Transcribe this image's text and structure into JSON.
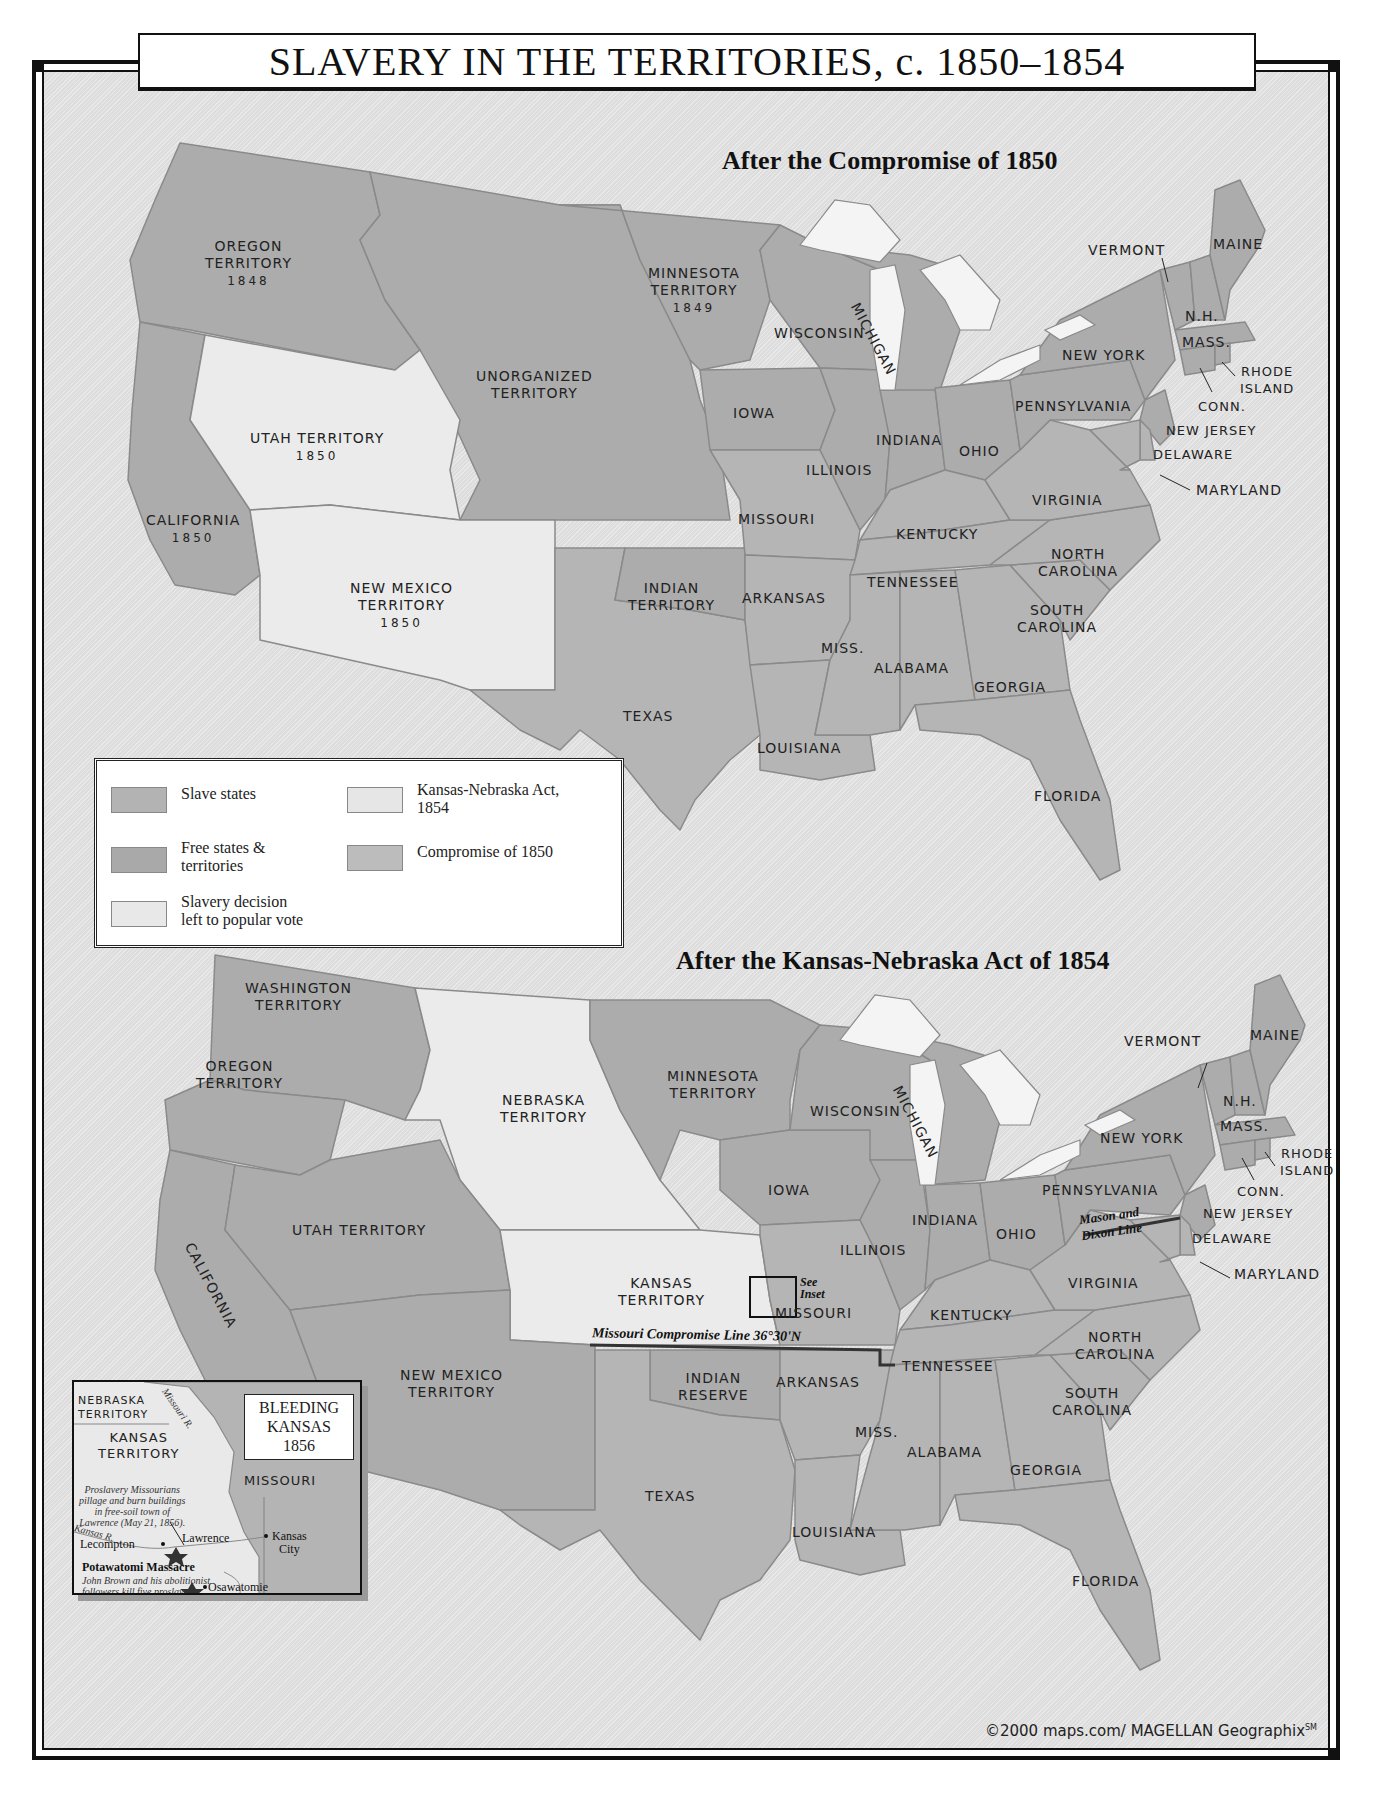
{
  "title": "SLAVERY IN THE TERRITORIES, c. 1850–1854",
  "colors": {
    "slave_states": "#b3b3b3",
    "free_states": "#a9a9a9",
    "popular_vote": "#e8e8e8",
    "kansas_nebraska": "#e6e6e6",
    "compromise_1850": "#bcbcbc",
    "water": "#f2f2f2",
    "background": "#e4e4e4"
  },
  "map_1850": {
    "subtitle": "After the Compromise of 1850",
    "labels": {
      "oregon": {
        "name": "OREGON\nTERRITORY",
        "year": "1848"
      },
      "minnesota": {
        "name": "MINNESOTA\nTERRITORY",
        "year": "1849"
      },
      "unorganized": {
        "name": "UNORGANIZED\nTERRITORY"
      },
      "utah": {
        "name": "UTAH TERRITORY",
        "year": "1850"
      },
      "california": {
        "name": "CALIFORNIA",
        "year": "1850"
      },
      "new_mexico": {
        "name": "NEW MEXICO\nTERRITORY",
        "year": "1850"
      },
      "indian": {
        "name": "INDIAN\nTERRITORY"
      },
      "texas": "TEXAS",
      "wisconsin": "WISCONSIN",
      "michigan": "MICHIGAN",
      "iowa": "IOWA",
      "illinois": "ILLINOIS",
      "indiana": "INDIANA",
      "ohio": "OHIO",
      "missouri": "MISSOURI",
      "kentucky": "KENTUCKY",
      "tennessee": "TENNESSEE",
      "arkansas": "ARKANSAS",
      "louisiana": "LOUISIANA",
      "miss": "MISS.",
      "alabama": "ALABAMA",
      "georgia": "GEORGIA",
      "florida": "FLORIDA",
      "south_carolina": "SOUTH\nCAROLINA",
      "north_carolina": "NORTH\nCAROLINA",
      "virginia": "VIRGINIA",
      "pennsylvania": "PENNSYLVANIA",
      "new_york": "NEW YORK",
      "vermont": "VERMONT",
      "maine": "MAINE",
      "nh": "N.H.",
      "mass": "MASS.",
      "rhode_island": "RHODE\nISLAND",
      "conn": "CONN.",
      "new_jersey": "NEW JERSEY",
      "delaware": "DELAWARE",
      "maryland": "MARYLAND"
    }
  },
  "map_1854": {
    "subtitle": "After the Kansas-Nebraska Act of 1854",
    "labels": {
      "washington": "WASHINGTON\nTERRITORY",
      "oregon": "OREGON\nTERRITORY",
      "nebraska": "NEBRASKA\nTERRITORY",
      "minnesota": "MINNESOTA\nTERRITORY",
      "california": "CALIFORNIA",
      "utah": "UTAH TERRITORY",
      "kansas": "KANSAS\nTERRITORY",
      "new_mexico": "NEW MEXICO\nTERRITORY",
      "indian": "INDIAN\nRESERVE",
      "texas": "TEXAS",
      "wisconsin": "WISCONSIN",
      "michigan": "MICHIGAN",
      "iowa": "IOWA",
      "illinois": "ILLINOIS",
      "indiana": "INDIANA",
      "ohio": "OHIO",
      "missouri": "MISSOURI",
      "kentucky": "KENTUCKY",
      "tennessee": "TENNESSEE",
      "arkansas": "ARKANSAS",
      "louisiana": "LOUISIANA",
      "miss": "MISS.",
      "alabama": "ALABAMA",
      "georgia": "GEORGIA",
      "florida": "FLORIDA",
      "south_carolina": "SOUTH\nCAROLINA",
      "north_carolina": "NORTH\nCAROLINA",
      "virginia": "VIRGINIA",
      "pennsylvania": "PENNSYLVANIA",
      "new_york": "NEW YORK",
      "vermont": "VERMONT",
      "maine": "MAINE",
      "nh": "N.H.",
      "mass": "MASS.",
      "rhode_island": "RHODE\nISLAND",
      "conn": "CONN.",
      "new_jersey": "NEW JERSEY",
      "delaware": "DELAWARE",
      "maryland": "MARYLAND",
      "mason_dixon": "Mason and\nDixon Line",
      "missouri_compromise": "Missouri Compromise Line 36°30'N",
      "see_inset": "See\nInset"
    }
  },
  "legend": {
    "items": [
      {
        "label": "Slave states",
        "key": "slave_states"
      },
      {
        "label": "Free states &\nterritories",
        "key": "free_states"
      },
      {
        "label": "Slavery decision\nleft to popular vote",
        "key": "popular_vote"
      },
      {
        "label": "Kansas-Nebraska Act,\n1854",
        "key": "kansas_nebraska"
      },
      {
        "label": "Compromise of 1850",
        "key": "compromise_1850"
      }
    ]
  },
  "inset": {
    "title": "BLEEDING\nKANSAS\n1856",
    "nebraska": "NEBRASKA\nTERRITORY",
    "kansas": "KANSAS\nTERRITORY",
    "missouri": "MISSOURI",
    "missouri_river": "Missouri R.",
    "kansas_river": "Kansas R.",
    "lawrence_note": "Proslavery Missourians\npillage and burn buildings\nin free-soil town of\nLawrence (May 21, 1856).",
    "places": {
      "lecompton": "Lecompton",
      "lawrence": "Lawrence",
      "kansas_city": "Kansas\nCity",
      "osawatomie": "Osawatomie"
    },
    "massacre_title": "Potawatomi Massacre",
    "massacre_note": "John Brown and his abolitionist\nfollowers kill five proslavery\nimmigrants settled\nalong Potawatomi\nCreek (May 24, 1856)."
  },
  "credit": {
    "text": "©2000 maps.com/ MAGELLAN Geographix",
    "mark": "SM"
  },
  "page_number": "22"
}
